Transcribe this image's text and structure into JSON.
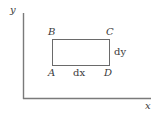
{
  "diagram": {
    "axes": {
      "x_label": "x",
      "y_label": "y",
      "color": "#777777"
    },
    "rectangle": {
      "color": "#666666",
      "corners": {
        "top_left": "B",
        "top_right": "C",
        "bottom_left": "A",
        "bottom_right": "D"
      },
      "width_label": "dx",
      "height_label": "dy"
    }
  }
}
